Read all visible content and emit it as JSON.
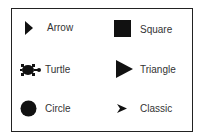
{
  "shapes": [
    {
      "name": "arrow",
      "label": "Arrow"
    },
    {
      "name": "square",
      "label": "Square"
    },
    {
      "name": "turtle",
      "label": "Turtle"
    },
    {
      "name": "triangle",
      "label": "Triangle"
    },
    {
      "name": "circle",
      "label": "Circle"
    },
    {
      "name": "classic",
      "label": "Classic"
    }
  ],
  "colors": {
    "border": "#222222",
    "icon": "#111111",
    "text": "#333333"
  }
}
